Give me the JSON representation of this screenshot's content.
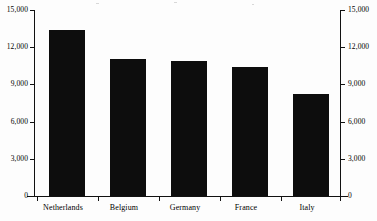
{
  "chart_data": {
    "type": "bar",
    "title": "",
    "subtitle": "",
    "xlabel": "",
    "ylabel": "",
    "categories": [
      "Netherlands",
      "Belgium",
      "Germany",
      "France",
      "Italy"
    ],
    "values": [
      13400,
      11050,
      10900,
      10400,
      8200
    ],
    "series": [
      {
        "name": "",
        "values": [
          13400,
          11050,
          10900,
          10400,
          8200
        ]
      }
    ],
    "ylim": [
      0,
      15000
    ],
    "yticks": [
      0,
      3000,
      6000,
      9000,
      12000,
      15000
    ],
    "ytick_labels": [
      "0",
      "3,000",
      "6,000",
      "9,000",
      "12,000",
      "15,000"
    ],
    "right_axis": {
      "visible": true,
      "ylim": [
        0,
        15000
      ],
      "yticks": [
        0,
        3000,
        6000,
        9000,
        12000,
        15000
      ],
      "ytick_labels": [
        "0",
        "3,000",
        "6,000",
        "9,000",
        "12,000",
        "15,000"
      ]
    },
    "grid": false,
    "legend": null,
    "legend_position": "none",
    "bar_color": "#0d0d0d",
    "background_color": "#ffffff",
    "axis_color": "#111111",
    "annotations": []
  },
  "axis_left": {
    "labels": [
      "15,000",
      "12,000",
      "9,000",
      "6,000",
      "3,000",
      "0"
    ]
  },
  "axis_right": {
    "labels": [
      "15,000",
      "12,000",
      "9,000",
      "6,000",
      "3,000",
      "0"
    ]
  },
  "categories": {
    "items": [
      {
        "label": "Netherlands"
      },
      {
        "label": "Belgium"
      },
      {
        "label": "Germany"
      },
      {
        "label": "France"
      },
      {
        "label": "Italy"
      }
    ]
  }
}
